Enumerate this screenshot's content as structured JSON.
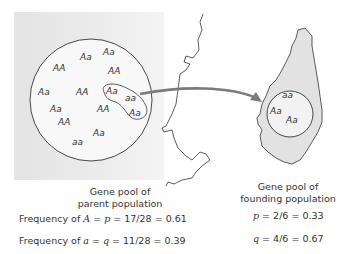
{
  "parent_pool": {
    "genotypes": [
      "Aa",
      "Aa",
      "AA",
      "AA",
      "Aa",
      "AA",
      "Aa",
      "aa",
      "Aa",
      "AA",
      "Aa",
      "AA",
      "Aa",
      "aa"
    ],
    "label_line1": "Gene pool of",
    "label_line2": "parent population",
    "freq_A": {
      "prefix": "Frequency of ",
      "allele": "A",
      "mid": " = ",
      "sym": "p",
      "rest": " = 17/28 = 0.61"
    },
    "freq_a": {
      "prefix": "Frequency of ",
      "allele": "a",
      "mid": " = ",
      "sym": "q",
      "rest": " = 11/28 = 0.39"
    }
  },
  "founding_pool": {
    "genotypes": [
      "aa",
      "Aa",
      "Aa"
    ],
    "label_line1": "Gene pool of",
    "label_line2": "founding population",
    "p": {
      "sym": "p",
      "rest": " = 2/6 = 0.33"
    },
    "q": {
      "sym": "q",
      "rest": " = 4/6 = 0.67"
    }
  },
  "colors": {
    "arrow": "#7a7a7a",
    "island_fill": "#e0e0e0",
    "mainland_fill": "#eaeaea",
    "line": "#333333"
  }
}
